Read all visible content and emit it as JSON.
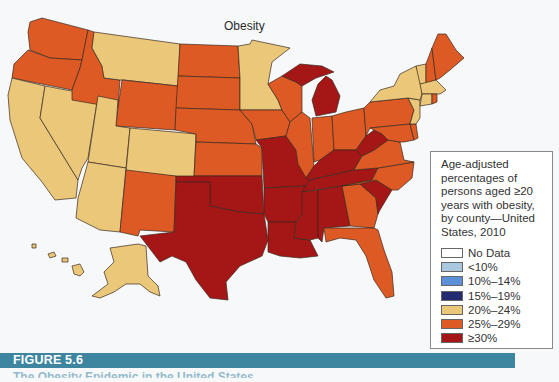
{
  "map": {
    "title": "Obesity",
    "colors": {
      "no_data": "#ffffff",
      "lt10": "#a9c8e0",
      "p10_14": "#5b8fd8",
      "p15_19": "#232a70",
      "p20_24": "#ebc77a",
      "p25_29": "#de5a24",
      "ge30": "#a51616"
    },
    "states": {
      "WA": "25%-29%",
      "OR": "25%-29%",
      "CA": "20%-24%",
      "NV": "20%-24%",
      "ID": "25%-29%",
      "MT": "20%-24%",
      "WY": "25%-29%",
      "UT": "20%-24%",
      "CO": "20%-24%",
      "AZ": "20%-24%",
      "NM": "25%-29%",
      "ND": "25%-29%",
      "SD": "25%-29%",
      "NE": "25%-29%",
      "KS": "25%-29%",
      "OK": ">=30%",
      "TX": ">=30%",
      "MN": "20%-24%",
      "IA": "25%-29%",
      "MO": ">=30%",
      "AR": ">=30%",
      "LA": ">=30%",
      "WI": "25%-29%",
      "IL": "25%-29%",
      "MI": ">=30%",
      "IN": "25%-29%",
      "OH": "25%-29%",
      "KY": ">=30%",
      "TN": ">=30%",
      "MS": ">=30%",
      "AL": ">=30%",
      "GA": "25%-29%",
      "FL": "25%-29%",
      "SC": ">=30%",
      "NC": "25%-29%",
      "VA": "25%-29%",
      "WV": ">=30%",
      "PA": "25%-29%",
      "NY": "20%-24%",
      "VT": "20%-24%",
      "NH": "25%-29%",
      "ME": "25%-29%",
      "MA": "20%-24%",
      "CT": "20%-24%",
      "RI": "25%-29%",
      "NJ": "20%-24%",
      "DE": "25%-29%",
      "MD": "25%-29%",
      "DC": ">=30%",
      "AK": "20%-24%",
      "HI": "20%-24%"
    }
  },
  "legend": {
    "heading": "Age-adjusted percentages of persons aged ≥20 years with obesity, by county—United States, 2010",
    "items": [
      {
        "label": "No Data",
        "color": "#ffffff"
      },
      {
        "label": "<10%",
        "color": "#a9c8e0"
      },
      {
        "label": "10%–14%",
        "color": "#5b8fd8"
      },
      {
        "label": "15%–19%",
        "color": "#232a70"
      },
      {
        "label": "20%–24%",
        "color": "#ebc77a"
      },
      {
        "label": "25%–29%",
        "color": "#de5a24"
      },
      {
        "label": "≥30%",
        "color": "#a51616"
      }
    ]
  },
  "figure": {
    "label": "FIGURE 5.6",
    "bar_color": "#3e86a0",
    "caption": "The Obesity Epidemic in the United States"
  }
}
